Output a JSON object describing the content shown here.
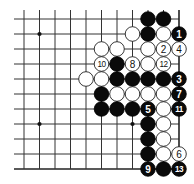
{
  "board": {
    "cols": 11,
    "rows": 11,
    "origin_x": 24,
    "origin_y": 19,
    "spacing_x": 15.5,
    "spacing_y": 15,
    "extend_left": 10,
    "extend_top": 9,
    "right_edge": true,
    "bottom_edge": true,
    "line_color": "#333333",
    "background": "#ffffff",
    "star_points": [
      [
        1,
        1
      ],
      [
        1,
        7
      ],
      [
        7,
        7
      ]
    ],
    "stones": [
      {
        "c": 8,
        "r": 0,
        "color": "black",
        "label": ""
      },
      {
        "c": 9,
        "r": 0,
        "color": "black",
        "label": ""
      },
      {
        "c": 7,
        "r": 1,
        "color": "white",
        "label": ""
      },
      {
        "c": 8,
        "r": 1,
        "color": "black",
        "label": ""
      },
      {
        "c": 9,
        "r": 1,
        "color": "white",
        "label": ""
      },
      {
        "c": 10,
        "r": 1,
        "color": "black",
        "label": "1"
      },
      {
        "c": 5,
        "r": 2,
        "color": "white",
        "label": ""
      },
      {
        "c": 6,
        "r": 2,
        "color": "white",
        "label": ""
      },
      {
        "c": 8,
        "r": 2,
        "color": "white",
        "label": ""
      },
      {
        "c": 9,
        "r": 2,
        "color": "white",
        "label": "2"
      },
      {
        "c": 10,
        "r": 2,
        "color": "white",
        "label": "4"
      },
      {
        "c": 5,
        "r": 3,
        "color": "white",
        "label": "10"
      },
      {
        "c": 6,
        "r": 3,
        "color": "black",
        "label": ""
      },
      {
        "c": 7,
        "r": 3,
        "color": "white",
        "label": "8"
      },
      {
        "c": 8,
        "r": 3,
        "color": "white",
        "label": ""
      },
      {
        "c": 9,
        "r": 3,
        "color": "white",
        "label": "12"
      },
      {
        "c": 4,
        "r": 4,
        "color": "white",
        "label": ""
      },
      {
        "c": 5,
        "r": 4,
        "color": "white",
        "label": ""
      },
      {
        "c": 6,
        "r": 4,
        "color": "black",
        "label": ""
      },
      {
        "c": 7,
        "r": 4,
        "color": "black",
        "label": ""
      },
      {
        "c": 8,
        "r": 4,
        "color": "black",
        "label": ""
      },
      {
        "c": 9,
        "r": 4,
        "color": "black",
        "label": ""
      },
      {
        "c": 10,
        "r": 4,
        "color": "black",
        "label": "3"
      },
      {
        "c": 5,
        "r": 5,
        "color": "black",
        "label": ""
      },
      {
        "c": 6,
        "r": 5,
        "color": "white",
        "label": ""
      },
      {
        "c": 7,
        "r": 5,
        "color": "white",
        "label": ""
      },
      {
        "c": 8,
        "r": 5,
        "color": "white",
        "label": ""
      },
      {
        "c": 9,
        "r": 5,
        "color": "white",
        "label": ""
      },
      {
        "c": 10,
        "r": 5,
        "color": "black",
        "label": "7"
      },
      {
        "c": 5,
        "r": 6,
        "color": "black",
        "label": ""
      },
      {
        "c": 6,
        "r": 6,
        "color": "black",
        "label": ""
      },
      {
        "c": 7,
        "r": 6,
        "color": "black",
        "label": ""
      },
      {
        "c": 8,
        "r": 6,
        "color": "black",
        "label": "5"
      },
      {
        "c": 9,
        "r": 6,
        "color": "white",
        "label": ""
      },
      {
        "c": 10,
        "r": 6,
        "color": "black",
        "label": "11"
      },
      {
        "c": 8,
        "r": 7,
        "color": "black",
        "label": ""
      },
      {
        "c": 9,
        "r": 7,
        "color": "white",
        "label": ""
      },
      {
        "c": 8,
        "r": 8,
        "color": "black",
        "label": ""
      },
      {
        "c": 9,
        "r": 8,
        "color": "white",
        "label": ""
      },
      {
        "c": 8,
        "r": 9,
        "color": "black",
        "label": ""
      },
      {
        "c": 9,
        "r": 9,
        "color": "white",
        "label": ""
      },
      {
        "c": 10,
        "r": 9,
        "color": "white",
        "label": "6"
      },
      {
        "c": 8,
        "r": 10,
        "color": "black",
        "label": "9"
      },
      {
        "c": 9,
        "r": 10,
        "color": "black",
        "label": ""
      },
      {
        "c": 10,
        "r": 10,
        "color": "black",
        "label": "13"
      }
    ]
  }
}
